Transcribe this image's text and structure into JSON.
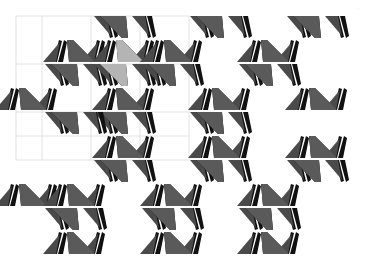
{
  "figure": {
    "type": "tessellation-pattern",
    "width": 375,
    "height": 272,
    "corner_mark": "·"
  },
  "colors": {
    "background": "#ffffff",
    "main_tile": "#5a5a5a",
    "highlight_tile": "#b4b4b4",
    "sail_dark": "#111111",
    "sail_mid": "#4a4a4a",
    "grid": "#e2e2e2"
  },
  "grid": {
    "x": [
      16,
      42,
      91,
      140,
      189
    ],
    "y": [
      16,
      64,
      112,
      136,
      160
    ],
    "x_range": [
      16,
      189
    ],
    "y_range": [
      16,
      160
    ]
  },
  "motif": {
    "description": "bow-tie cluster: big trapezoidal triangle with two feather/sail shapes on each side, mirrored top and bottom",
    "period_x": 97,
    "period_y": 48,
    "row_offset_x": 48
  },
  "tiles": [
    {
      "cx": 122,
      "cy": 14,
      "highlight": false,
      "top": false,
      "bottom": true
    },
    {
      "cx": 218,
      "cy": 14,
      "highlight": false,
      "top": false,
      "bottom": true
    },
    {
      "cx": 315,
      "cy": 14,
      "highlight": false,
      "top": false,
      "bottom": true
    },
    {
      "cx": 73,
      "cy": 62,
      "highlight": false,
      "top": true,
      "bottom": true
    },
    {
      "cx": 122,
      "cy": 62,
      "highlight": true,
      "top": true,
      "bottom": true
    },
    {
      "cx": 170,
      "cy": 62,
      "highlight": false,
      "top": true,
      "bottom": true
    },
    {
      "cx": 267,
      "cy": 62,
      "highlight": false,
      "top": true,
      "bottom": true
    },
    {
      "cx": 25,
      "cy": 110,
      "highlight": false,
      "top": true,
      "bottom": false
    },
    {
      "cx": 122,
      "cy": 110,
      "highlight": false,
      "top": true,
      "bottom": true
    },
    {
      "cx": 218,
      "cy": 110,
      "highlight": false,
      "top": true,
      "bottom": true
    },
    {
      "cx": 315,
      "cy": 110,
      "highlight": false,
      "top": true,
      "bottom": false
    },
    {
      "cx": 73,
      "cy": 110,
      "highlight": false,
      "top": false,
      "bottom": true
    },
    {
      "cx": 122,
      "cy": 158,
      "highlight": false,
      "top": true,
      "bottom": true
    },
    {
      "cx": 218,
      "cy": 158,
      "highlight": false,
      "top": true,
      "bottom": true
    },
    {
      "cx": 315,
      "cy": 158,
      "highlight": false,
      "top": true,
      "bottom": true
    },
    {
      "cx": 25,
      "cy": 206,
      "highlight": false,
      "top": true,
      "bottom": false
    },
    {
      "cx": 73,
      "cy": 206,
      "highlight": false,
      "top": true,
      "bottom": true
    },
    {
      "cx": 170,
      "cy": 206,
      "highlight": false,
      "top": true,
      "bottom": true
    },
    {
      "cx": 267,
      "cy": 206,
      "highlight": false,
      "top": true,
      "bottom": true
    },
    {
      "cx": 73,
      "cy": 254,
      "highlight": false,
      "top": true,
      "bottom": false
    },
    {
      "cx": 170,
      "cy": 254,
      "highlight": false,
      "top": true,
      "bottom": false
    },
    {
      "cx": 267,
      "cy": 254,
      "highlight": false,
      "top": true,
      "bottom": false
    }
  ]
}
